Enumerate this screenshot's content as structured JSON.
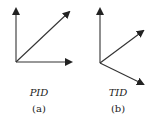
{
  "panels": [
    {
      "id": "a",
      "title": "PID",
      "caption": "(a)",
      "arrows": [
        {
          "name": "vertical",
          "from": [
            16,
            62
          ],
          "to": [
            16,
            9
          ]
        },
        {
          "name": "diagonal",
          "from": [
            16,
            62
          ],
          "to": [
            69,
            12
          ]
        },
        {
          "name": "horizontal",
          "from": [
            16,
            62
          ],
          "to": [
            71,
            62
          ]
        }
      ]
    },
    {
      "id": "b",
      "title": "TID",
      "caption": "(b)",
      "arrows": [
        {
          "name": "vertical",
          "from": [
            100,
            63
          ],
          "to": [
            100,
            9
          ]
        },
        {
          "name": "upper-right",
          "from": [
            100,
            63
          ],
          "to": [
            143,
            31
          ]
        },
        {
          "name": "lower-right",
          "from": [
            100,
            63
          ],
          "to": [
            143,
            84
          ]
        }
      ]
    }
  ],
  "colors": {
    "stroke": "#333333"
  }
}
